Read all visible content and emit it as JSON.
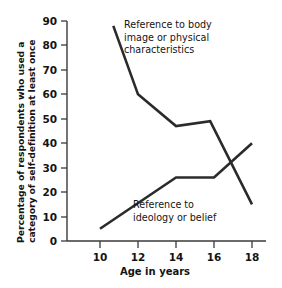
{
  "chart_data": {
    "type": "line",
    "title": "",
    "xlabel": "Age in years",
    "ylabel": "Percentage of respondents who used a category of self-definition at least once",
    "ylabel_line1": "Percentage of respondents who used a",
    "ylabel_line2": "category of self-definition at least once",
    "xlim": [
      9,
      19
    ],
    "ylim": [
      0,
      90
    ],
    "xticks": [
      10,
      12,
      14,
      16,
      18
    ],
    "xtick_labels": [
      "10",
      "12",
      "14",
      "16",
      "18"
    ],
    "yticks": [
      0,
      10,
      20,
      30,
      40,
      50,
      60,
      70,
      80,
      90
    ],
    "ytick_labels": [
      "0",
      "10",
      "20",
      "30",
      "40",
      "50",
      "60",
      "70",
      "80",
      "90"
    ],
    "grid": false,
    "legend_position": "inline-annotations",
    "line_color": "#2b2b2b",
    "series": [
      {
        "name": "Reference to body image or physical characteristics",
        "x": [
          10.7,
          12,
          14,
          15.8,
          18
        ],
        "values": [
          88,
          60,
          47,
          49,
          15
        ]
      },
      {
        "name": "Reference to ideology or belief",
        "x": [
          10,
          14,
          16,
          18
        ],
        "values": [
          5,
          26,
          26,
          40
        ]
      }
    ],
    "annotations": [
      {
        "id": "annotation-body-image",
        "lines": [
          "Reference to body",
          "image or physical",
          "characteristics"
        ],
        "x": 124,
        "y": 28
      },
      {
        "id": "annotation-ideology",
        "lines": [
          "Reference to",
          "ideology or belief"
        ],
        "x": 133,
        "y": 208
      }
    ]
  }
}
